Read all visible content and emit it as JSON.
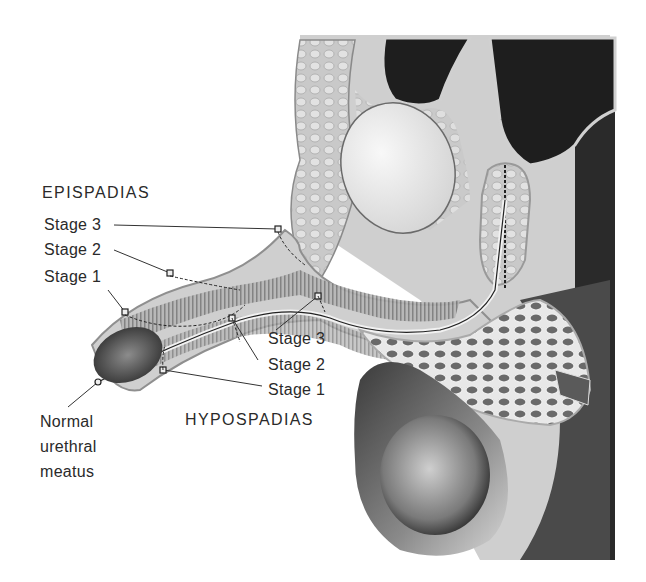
{
  "figure": {
    "epispadias": {
      "heading": "EPISPADIAS",
      "stages": [
        "Stage 3",
        "Stage 2",
        "Stage 1"
      ]
    },
    "hypospadias": {
      "heading": "HYPOSPADIAS",
      "stages": [
        "Stage 3",
        "Stage 2",
        "Stage 1"
      ]
    },
    "normal": {
      "lines": [
        "Normal",
        "urethral",
        "meatus"
      ]
    }
  },
  "colors": {
    "background": "#ffffff",
    "text": "#2a2a2a",
    "dark_cavity": "#1e1e1e",
    "tissue_light": "#d8d8d8",
    "tissue_mid": "#9a9a9a",
    "bladder": "#ececec"
  }
}
